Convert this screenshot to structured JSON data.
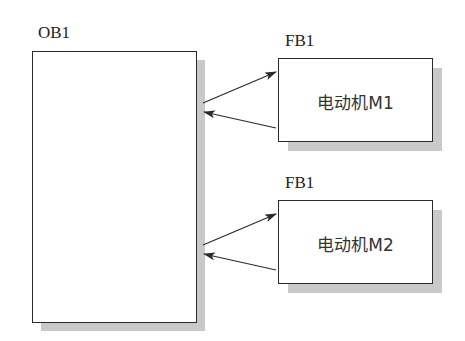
{
  "diagram": {
    "main_block": {
      "label": "OB1"
    },
    "function_blocks": [
      {
        "label": "FB1",
        "instance_text": "电动机M1"
      },
      {
        "label": "FB1",
        "instance_text": "电动机M2"
      }
    ],
    "connections": [
      {
        "from": "OB1",
        "to": "电动机M1",
        "type": "call"
      },
      {
        "from": "电动机M1",
        "to": "OB1",
        "type": "return"
      },
      {
        "from": "OB1",
        "to": "电动机M2",
        "type": "call"
      },
      {
        "from": "电动机M2",
        "to": "OB1",
        "type": "return"
      }
    ],
    "colors": {
      "line": "#2a2a2a",
      "shadow": "#c9c9c9",
      "background": "#ffffff"
    }
  }
}
